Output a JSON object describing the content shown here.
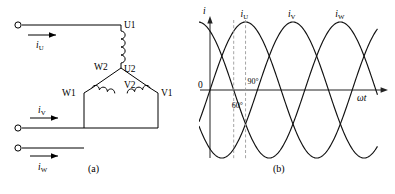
{
  "figure": {
    "caption_a": "(a)",
    "caption_b": "(b)"
  },
  "circuit": {
    "title": "three-phase Y-connected stator winding",
    "terminal_labels": {
      "u1": "U1",
      "u2": "U2",
      "v1": "V1",
      "v2": "V2",
      "w1": "W1",
      "w2": "W2"
    },
    "current_labels": {
      "iu": "i",
      "iu_sub": "U",
      "iv": "i",
      "iv_sub": "V",
      "iw": "i",
      "iw_sub": "W"
    },
    "lead_count": 3,
    "terminal_dot_count": 3
  },
  "chart_data": {
    "type": "line",
    "title": "",
    "xlabel": "ωt",
    "ylabel": "i",
    "y_origin_label": "0",
    "xlim": [
      -30,
      420
    ],
    "ylim": [
      -1.25,
      1.25
    ],
    "grid": false,
    "legend_position": "above-peaks",
    "x_unit": "degrees",
    "annotations": [
      {
        "label": "60°",
        "x": 60,
        "type": "dashed-vertical"
      },
      {
        "label": "90°",
        "x": 90,
        "type": "dashed-vertical"
      }
    ],
    "series": [
      {
        "name": "i",
        "name_sub": "U",
        "phase_deg": 0,
        "amplitude": 1,
        "label_x": 90,
        "color": "#111111"
      },
      {
        "name": "i",
        "name_sub": "V",
        "phase_deg": -120,
        "amplitude": 1,
        "label_x": 210,
        "color": "#111111"
      },
      {
        "name": "i",
        "name_sub": "W",
        "phase_deg": -240,
        "amplitude": 1,
        "label_x": 330,
        "color": "#111111"
      }
    ]
  },
  "colors": {
    "ink": "#000000",
    "axis": "#222222",
    "dashed_guide": "#9a9a9a",
    "background": "#ffffff"
  }
}
